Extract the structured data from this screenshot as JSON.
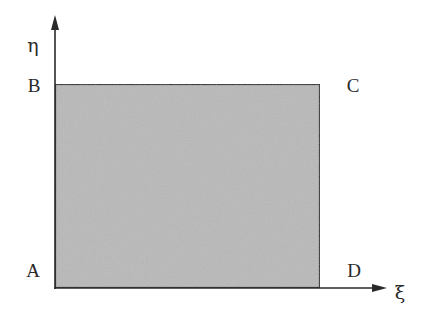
{
  "diagram": {
    "title": "",
    "axes": {
      "x_label": "ξ",
      "y_label": "η"
    },
    "vertices": {
      "A": "A",
      "B": "B",
      "C": "C",
      "D": "D"
    },
    "colors": {
      "fill": "#b9b9b9",
      "stroke": "#2a2a2a",
      "axis": "#2a2a2a",
      "text": "#2a2a2a",
      "background": "#ffffff"
    },
    "geometry": {
      "rect": {
        "x": 55,
        "y": 84,
        "width": 265,
        "height": 204
      },
      "y_axis": {
        "x": 55,
        "y_top": 17,
        "y_bottom": 288
      },
      "x_axis": {
        "y": 288,
        "x_left": 55,
        "x_right": 386
      }
    }
  }
}
